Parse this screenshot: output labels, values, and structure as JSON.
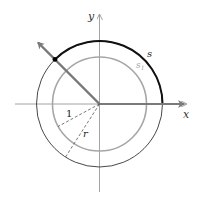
{
  "diagram": {
    "type": "unit-circle-arc-length",
    "labels": {
      "x_axis": "x",
      "y_axis": "y",
      "outer_arc": "s",
      "inner_arc": "s",
      "inner_arc_subscript": "1",
      "inner_radius": "1",
      "outer_radius": "r"
    },
    "colors": {
      "outer_circle": "#333333",
      "outer_arc_highlight": "#111111",
      "inner_circle": "#a6a6a6",
      "axes": "#8c8c8c",
      "terminal_ray": "#777777",
      "dashed_radii": "#555555",
      "point": "#000000"
    },
    "geometry": {
      "center": [
        99.5,
        104
      ],
      "outer_radius": 63,
      "inner_radius": 47,
      "angle_degrees": 135
    }
  }
}
